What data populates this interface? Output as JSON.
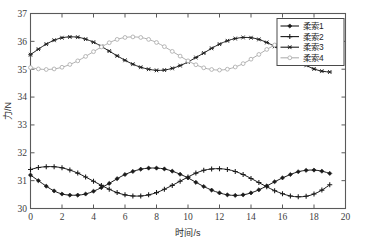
{
  "chart_data": {
    "type": "line",
    "title": "",
    "xlabel": "时间/s",
    "ylabel": "力/N",
    "xlim": [
      0,
      20
    ],
    "ylim": [
      30,
      37
    ],
    "xticks": [
      "0",
      "2",
      "4",
      "6",
      "8",
      "10",
      "12",
      "14",
      "16",
      "18",
      "20"
    ],
    "yticks": [
      "30",
      "31",
      "32",
      "33",
      "34",
      "35",
      "36",
      "37"
    ],
    "grid": false,
    "legend_position": "top-right",
    "series": [
      {
        "name": "柔索1",
        "label": "柔索1",
        "color": "#1a1a1a",
        "marker": "diamond",
        "mean": 30.97,
        "amplitude": 0.48,
        "period": 11.2,
        "phase_deg": 190,
        "x": [
          0,
          0.5,
          1,
          1.5,
          2,
          2.5,
          3,
          3.5,
          4,
          4.5,
          5,
          5.5,
          6,
          6.5,
          7,
          7.5,
          8,
          8.5,
          9,
          9.5,
          10,
          10.5,
          11,
          11.5,
          12,
          12.5,
          13,
          13.5,
          14,
          14.5,
          15,
          15.5,
          16,
          16.5,
          17,
          17.5,
          18,
          18.5,
          19
        ],
        "y": [
          31.2,
          31.0,
          30.8,
          30.63,
          30.52,
          30.48,
          30.48,
          30.52,
          30.62,
          30.75,
          30.9,
          31.07,
          31.22,
          31.33,
          31.41,
          31.45,
          31.45,
          31.42,
          31.34,
          31.23,
          31.1,
          30.94,
          30.79,
          30.66,
          30.56,
          30.49,
          30.47,
          30.49,
          30.56,
          30.67,
          30.81,
          30.96,
          31.1,
          31.22,
          31.32,
          31.37,
          31.38,
          31.34,
          31.26
        ]
      },
      {
        "name": "柔索2",
        "label": "柔索2",
        "color": "#1a1a1a",
        "marker": "plus",
        "mean": 30.98,
        "amplitude": 0.52,
        "period": 11.2,
        "phase_deg": 60,
        "x": [
          0,
          0.5,
          1,
          1.5,
          2,
          2.5,
          3,
          3.5,
          4,
          4.5,
          5,
          5.5,
          6,
          6.5,
          7,
          7.5,
          8,
          8.5,
          9,
          9.5,
          10,
          10.5,
          11,
          11.5,
          12,
          12.5,
          13,
          13.5,
          14,
          14.5,
          15,
          15.5,
          16,
          16.5,
          17,
          17.5,
          18,
          18.5,
          19
        ],
        "y": [
          31.4,
          31.47,
          31.5,
          31.5,
          31.46,
          31.38,
          31.27,
          31.13,
          30.98,
          30.83,
          30.69,
          30.57,
          30.49,
          30.45,
          30.45,
          30.49,
          30.57,
          30.69,
          30.83,
          30.98,
          31.13,
          31.27,
          31.37,
          31.42,
          31.43,
          31.4,
          31.33,
          31.22,
          31.08,
          30.93,
          30.78,
          30.64,
          30.53,
          30.45,
          30.42,
          30.44,
          30.52,
          30.66,
          30.85
        ]
      },
      {
        "name": "柔索3",
        "label": "柔索3",
        "color": "#1f1f1f",
        "marker": "star",
        "mean": 35.55,
        "amplitude": 0.6,
        "period": 11.2,
        "phase_deg": 273,
        "x": [
          0,
          0.5,
          1,
          1.5,
          2,
          2.5,
          3,
          3.5,
          4,
          4.5,
          5,
          5.5,
          6,
          6.5,
          7,
          7.5,
          8,
          8.5,
          9,
          9.5,
          10,
          10.5,
          11,
          11.5,
          12,
          12.5,
          13,
          13.5,
          14,
          14.5,
          15,
          15.5,
          16,
          16.5,
          17,
          17.5,
          18,
          18.5,
          19
        ],
        "y": [
          35.52,
          35.72,
          35.9,
          36.04,
          36.13,
          36.16,
          36.15,
          36.08,
          35.97,
          35.82,
          35.65,
          35.48,
          35.32,
          35.18,
          35.07,
          35.0,
          34.96,
          34.97,
          35.03,
          35.13,
          35.26,
          35.42,
          35.58,
          35.75,
          35.9,
          36.02,
          36.1,
          36.14,
          36.13,
          36.07,
          35.96,
          35.82,
          35.65,
          35.47,
          35.3,
          35.14,
          35.01,
          34.93,
          34.9
        ]
      },
      {
        "name": "柔索4",
        "label": "柔索4",
        "color": "#b0b0b0",
        "marker": "circle",
        "mean": 35.57,
        "amplitude": 0.59,
        "period": 11.2,
        "phase_deg": 160,
        "x": [
          0,
          0.5,
          1,
          1.5,
          2,
          2.5,
          3,
          3.5,
          4,
          4.5,
          5,
          5.5,
          6,
          6.5,
          7,
          7.5,
          8,
          8.5,
          9,
          9.5,
          10,
          10.5,
          11,
          11.5,
          12,
          12.5,
          13,
          13.5,
          14,
          14.5,
          15,
          15.5,
          16,
          16.5,
          17,
          17.5,
          18,
          18.5,
          19
        ],
        "y": [
          35.06,
          35.01,
          34.99,
          35.01,
          35.07,
          35.17,
          35.3,
          35.46,
          35.63,
          35.8,
          35.95,
          36.07,
          36.14,
          36.16,
          36.14,
          36.07,
          35.96,
          35.81,
          35.64,
          35.47,
          35.3,
          35.16,
          35.05,
          34.99,
          34.97,
          35.0,
          35.08,
          35.2,
          35.36,
          35.53,
          35.71,
          35.87,
          36.01,
          36.11,
          36.16,
          36.16,
          36.11,
          36.01,
          35.88
        ]
      }
    ]
  },
  "legend": {
    "items": [
      {
        "label": "柔索1"
      },
      {
        "label": "柔索2"
      },
      {
        "label": "柔索3"
      },
      {
        "label": "柔索4"
      }
    ]
  },
  "colors": {
    "axis": "#5a5a5a",
    "dark_series": "#1a1a1a",
    "gray_series": "#b0b0b0",
    "background": "#ffffff"
  }
}
